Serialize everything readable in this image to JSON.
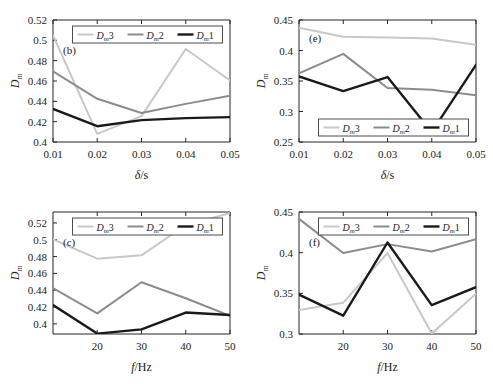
{
  "figure": {
    "background": "#ffffff",
    "series_colors": {
      "Dm3": "#c8c8c8",
      "Dm2": "#8c8c8c",
      "Dm1": "#1a1a1a"
    },
    "series_widths": {
      "Dm3": 2,
      "Dm2": 2,
      "Dm1": 2.4
    }
  },
  "chart_data": [
    {
      "id": "panel_b",
      "type": "line",
      "title": "",
      "panel_tag": "(b)",
      "xlabel": "δ/s",
      "ylabel": "Dₘ",
      "x": [
        0.01,
        0.02,
        0.03,
        0.04,
        0.05
      ],
      "xticks": [
        "0.01",
        "0.02",
        "0.03",
        "0.04",
        "0.05"
      ],
      "xlim": [
        0.01,
        0.05
      ],
      "ylim": [
        0.4,
        0.52
      ],
      "yticks": [
        "0.4",
        "0.42",
        "0.44",
        "0.46",
        "0.48",
        "0.5",
        "0.52"
      ],
      "ytick_values": [
        0.4,
        0.42,
        0.44,
        0.46,
        0.48,
        0.5,
        0.52
      ],
      "grid": false,
      "legend_position": "top-center",
      "series": [
        {
          "name": "Dₘ3",
          "key": "Dm3",
          "values": [
            0.505,
            0.408,
            0.4255,
            0.4915,
            0.4605
          ]
        },
        {
          "name": "Dₘ2",
          "key": "Dm2",
          "values": [
            0.4695,
            0.4425,
            0.4285,
            0.4375,
            0.4455
          ]
        },
        {
          "name": "Dₘ1",
          "key": "Dm1",
          "values": [
            0.4325,
            0.4155,
            0.4215,
            0.4235,
            0.4245
          ]
        }
      ]
    },
    {
      "id": "panel_e",
      "type": "line",
      "title": "",
      "panel_tag": "(e)",
      "xlabel": "δ/s",
      "ylabel": "Dₘ",
      "x": [
        0.01,
        0.02,
        0.03,
        0.04,
        0.05
      ],
      "xticks": [
        "0.01",
        "0.02",
        "0.03",
        "0.04",
        "0.05"
      ],
      "xlim": [
        0.01,
        0.05
      ],
      "ylim": [
        0.25,
        0.45
      ],
      "yticks": [
        "0.25",
        "0.3",
        "0.35",
        "0.4",
        "0.45"
      ],
      "ytick_values": [
        0.25,
        0.3,
        0.35,
        0.4,
        0.45
      ],
      "grid": false,
      "legend_position": "bottom-center",
      "series": [
        {
          "name": "Dₘ3",
          "key": "Dm3",
          "values": [
            0.4375,
            0.4225,
            0.4215,
            0.4195,
            0.4095
          ]
        },
        {
          "name": "Dₘ2",
          "key": "Dm2",
          "values": [
            0.3625,
            0.3945,
            0.3385,
            0.3355,
            0.3265
          ]
        },
        {
          "name": "Dₘ1",
          "key": "Dm1",
          "values": [
            0.3575,
            0.3335,
            0.3565,
            0.2665,
            0.3765
          ]
        }
      ]
    },
    {
      "id": "panel_c",
      "type": "line",
      "title": "",
      "panel_tag": "(c)",
      "xlabel": "f/Hz",
      "ylabel": "Dₘ",
      "x": [
        10,
        20,
        30,
        40,
        50
      ],
      "xticks": [
        "20",
        "30",
        "40",
        "50"
      ],
      "xtick_values": [
        20,
        30,
        40,
        50
      ],
      "xlim": [
        10,
        50
      ],
      "ylim": [
        0.388,
        0.533
      ],
      "yticks": [
        "0.4",
        "0.42",
        "0.44",
        "0.46",
        "0.48",
        "0.5",
        "0.52"
      ],
      "ytick_values": [
        0.4,
        0.42,
        0.44,
        0.46,
        0.48,
        0.5,
        0.52
      ],
      "grid": false,
      "legend_position": "top-center",
      "series": [
        {
          "name": "Dₘ3",
          "key": "Dm3",
          "values": [
            0.5005,
            0.4775,
            0.4815,
            0.5175,
            0.5315
          ]
        },
        {
          "name": "Dₘ2",
          "key": "Dm2",
          "values": [
            0.4425,
            0.4125,
            0.4495,
            0.4305,
            0.4095
          ]
        },
        {
          "name": "Dₘ1",
          "key": "Dm1",
          "values": [
            0.4225,
            0.3885,
            0.3935,
            0.4135,
            0.4105
          ]
        }
      ]
    },
    {
      "id": "panel_f",
      "type": "line",
      "title": "",
      "panel_tag": "(f)",
      "xlabel": "f/Hz",
      "ylabel": "Dₘ",
      "x": [
        10,
        20,
        30,
        40,
        50
      ],
      "xticks": [
        "20",
        "30",
        "40",
        "50"
      ],
      "xtick_values": [
        20,
        30,
        40,
        50
      ],
      "xlim": [
        10,
        50
      ],
      "ylim": [
        0.3,
        0.45
      ],
      "yticks": [
        "0.3",
        "0.35",
        "0.4",
        "0.45"
      ],
      "ytick_values": [
        0.3,
        0.35,
        0.4,
        0.45
      ],
      "grid": false,
      "legend_position": "top-center",
      "series": [
        {
          "name": "Dₘ3",
          "key": "Dm3",
          "values": [
            0.3295,
            0.3385,
            0.3995,
            0.3005,
            0.3495
          ]
        },
        {
          "name": "Dₘ2",
          "key": "Dm2",
          "values": [
            0.4415,
            0.3995,
            0.4105,
            0.4015,
            0.4165
          ]
        },
        {
          "name": "Dₘ1",
          "key": "Dm1",
          "values": [
            0.3485,
            0.3225,
            0.4125,
            0.3355,
            0.3575
          ]
        }
      ]
    }
  ],
  "panels_layout": [
    {
      "id": "panel_b",
      "left": 0,
      "top": 0,
      "width": 247,
      "height": 192
    },
    {
      "id": "panel_e",
      "left": 246,
      "top": 0,
      "width": 247,
      "height": 192
    },
    {
      "id": "panel_c",
      "left": 0,
      "top": 192,
      "width": 247,
      "height": 192
    },
    {
      "id": "panel_f",
      "left": 246,
      "top": 192,
      "width": 247,
      "height": 192
    }
  ]
}
